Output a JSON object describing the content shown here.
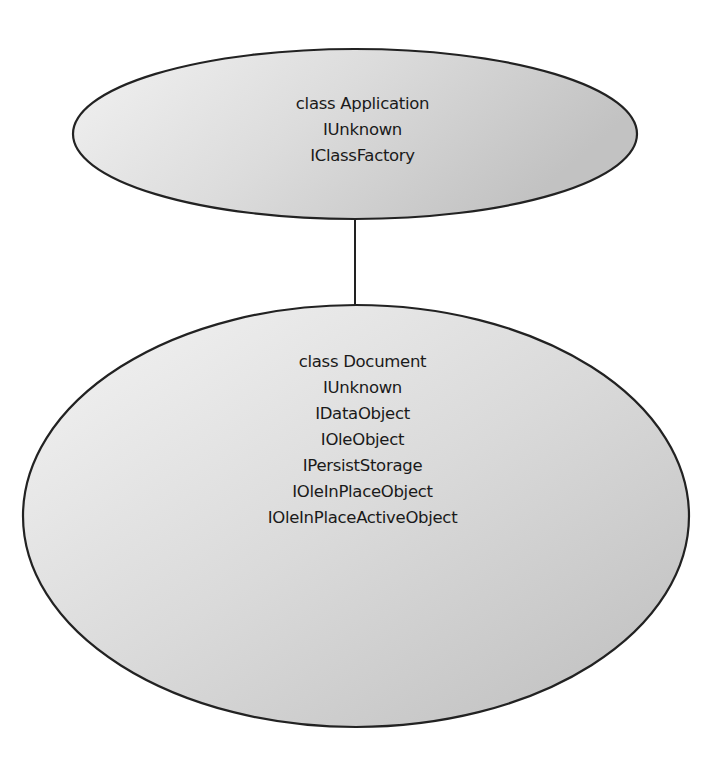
{
  "diagram": {
    "colors": {
      "background": "#ffffff",
      "stroke": "#222222",
      "fill_light": "#f0f0f0",
      "fill_dark": "#c4c4c4",
      "text": "#1a1a1a"
    },
    "nodes": [
      {
        "id": "application",
        "shape": "ellipse",
        "lines": [
          "class Application",
          "IUnknown",
          "IClassFactory"
        ]
      },
      {
        "id": "document",
        "shape": "ellipse",
        "lines": [
          "class Document",
          "IUnknown",
          "IDataObject",
          "IOleObject",
          "IPersistStorage",
          "IOleInPlaceObject",
          "IOleInPlaceActiveObject"
        ]
      }
    ],
    "edges": [
      {
        "from": "application",
        "to": "document",
        "style": "solid-line"
      }
    ]
  }
}
